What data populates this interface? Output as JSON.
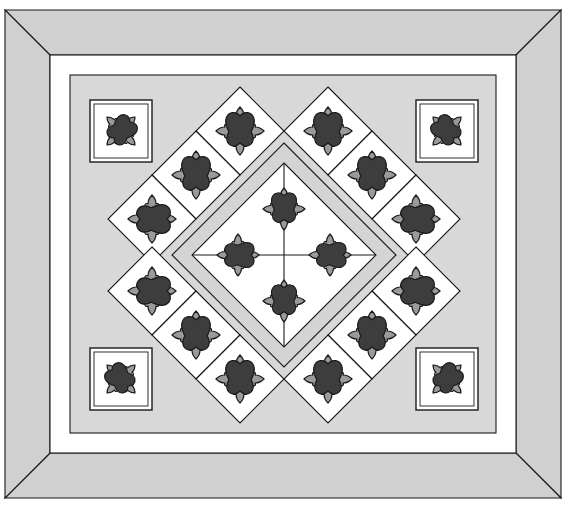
{
  "title": "Diagram A",
  "canvas": {
    "width": 569,
    "height": 507
  },
  "palette": {
    "outer_border_fill": "#d0d0d0",
    "inner_border_fill": "#ffffff",
    "field_fill": "#d8d8d8",
    "block_background": "#ffffff",
    "sashing_fill": "#d4d4d4",
    "motif_dark": "#3d3d3d",
    "motif_medium": "#9a9a9a",
    "outline": "#1a1a1a",
    "page_background": "#ffffff"
  },
  "quilt": {
    "name": "medallion-applique-quilt",
    "outer_frame": {
      "x": 5,
      "y": 10,
      "width": 556,
      "height": 488
    },
    "borders": [
      {
        "name": "outer-border",
        "fill_key": "outer_border_fill",
        "thickness": 45,
        "mitered": true
      },
      {
        "name": "inner-white-border",
        "fill_key": "inner_border_fill",
        "thickness": 20,
        "mitered": false
      }
    ],
    "field": {
      "name": "center-field",
      "x": 70,
      "y": 75,
      "width": 426,
      "height": 358,
      "fill_key": "field_fill"
    },
    "corner_blocks": [
      {
        "name": "corner-block-top-left",
        "cx": 121,
        "cy": 131,
        "size": 62,
        "motif": "applique-flower-diagonal-nw"
      },
      {
        "name": "corner-block-top-right",
        "cx": 447,
        "cy": 131,
        "size": 62,
        "motif": "applique-flower-diagonal-ne"
      },
      {
        "name": "corner-block-bottom-left",
        "cx": 121,
        "cy": 379,
        "size": 62,
        "motif": "applique-flower-diagonal-sw"
      },
      {
        "name": "corner-block-bottom-right",
        "cx": 447,
        "cy": 379,
        "size": 62,
        "motif": "applique-flower-diagonal-se"
      }
    ],
    "outer_diamond_ring": {
      "name": "on-point-diamond-ring",
      "count": 12,
      "half_diagonal": 44,
      "blocks": [
        {
          "name": "diamond-top-left-upper",
          "cx": 240,
          "cy": 131,
          "motif_rotation": 0
        },
        {
          "name": "diamond-top-right-upper",
          "cx": 328,
          "cy": 131,
          "motif_rotation": 0
        },
        {
          "name": "diamond-upper-left-mid",
          "cx": 196,
          "cy": 175,
          "motif_rotation": 0
        },
        {
          "name": "diamond-upper-right-mid",
          "cx": 372,
          "cy": 175,
          "motif_rotation": 0
        },
        {
          "name": "diamond-left-upper",
          "cx": 152,
          "cy": 219,
          "motif_rotation": 90
        },
        {
          "name": "diamond-right-upper",
          "cx": 416,
          "cy": 219,
          "motif_rotation": 90
        },
        {
          "name": "diamond-left-lower",
          "cx": 152,
          "cy": 291,
          "motif_rotation": 90
        },
        {
          "name": "diamond-right-lower",
          "cx": 416,
          "cy": 291,
          "motif_rotation": 90
        },
        {
          "name": "diamond-lower-left-mid",
          "cx": 196,
          "cy": 335,
          "motif_rotation": 0
        },
        {
          "name": "diamond-lower-right-mid",
          "cx": 372,
          "cy": 335,
          "motif_rotation": 0
        },
        {
          "name": "diamond-bottom-left-lower",
          "cx": 240,
          "cy": 379,
          "motif_rotation": 0
        },
        {
          "name": "diamond-bottom-right-lower",
          "cx": 328,
          "cy": 379,
          "motif_rotation": 0
        }
      ]
    },
    "center_medallion": {
      "name": "center-medallion",
      "cx": 284,
      "cy": 255,
      "sashing_half_diagonal": 112,
      "inner_half_diagonal": 92,
      "quadrant_blocks": [
        {
          "name": "center-block-north",
          "cx": 284,
          "cy": 209,
          "motif_rotation": 0
        },
        {
          "name": "center-block-west",
          "cx": 238,
          "cy": 255,
          "motif_rotation": 90
        },
        {
          "name": "center-block-east",
          "cx": 330,
          "cy": 255,
          "motif_rotation": 90
        },
        {
          "name": "center-block-south",
          "cx": 284,
          "cy": 301,
          "motif_rotation": 0
        }
      ]
    }
  },
  "legend": {
    "motif_name": "applique-flower",
    "motif_parts": [
      "center-heart-dark",
      "petal-top",
      "petal-bottom",
      "petal-left",
      "petal-right"
    ]
  }
}
